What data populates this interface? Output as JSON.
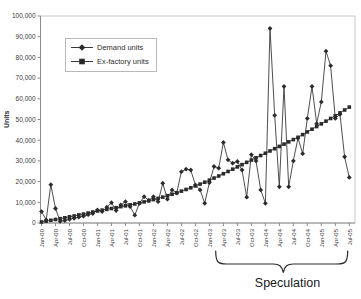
{
  "chart_data": {
    "type": "line",
    "title": "",
    "xlabel": "",
    "ylabel": "Units",
    "ylim": [
      0,
      100000
    ],
    "ytick_step": 10000,
    "grid": false,
    "legend_position": "upper-left-inside",
    "x_tick_every": 3,
    "x_categories": [
      "Jan-00",
      "Feb-00",
      "Mar-00",
      "Apr-00",
      "May-00",
      "Jun-00",
      "Jul-00",
      "Aug-00",
      "Sep-00",
      "Oct-00",
      "Nov-00",
      "Dec-00",
      "Jan-01",
      "Feb-01",
      "Mar-01",
      "Apr-01",
      "May-01",
      "Jun-01",
      "Jul-01",
      "Aug-01",
      "Sep-01",
      "Oct-01",
      "Nov-01",
      "Dec-01",
      "Jan-02",
      "Feb-02",
      "Mar-02",
      "Apr-02",
      "May-02",
      "Jun-02",
      "Jul-02",
      "Aug-02",
      "Sep-02",
      "Oct-02",
      "Nov-02",
      "Dec-02",
      "Jan-03",
      "Feb-03",
      "Mar-03",
      "Apr-03",
      "May-03",
      "Jun-03",
      "Jul-03",
      "Aug-03",
      "Sep-03",
      "Oct-03",
      "Nov-03",
      "Dec-03",
      "Jan-04",
      "Feb-04",
      "Mar-04",
      "Apr-04",
      "May-04",
      "Jun-04",
      "Jul-04",
      "Aug-04",
      "Sep-04",
      "Oct-04",
      "Nov-04",
      "Dec-04",
      "Jan-05",
      "Feb-05",
      "Mar-05",
      "Apr-05",
      "May-05",
      "Jun-05",
      "Jul-05"
    ],
    "series": [
      {
        "name": "Demand units",
        "marker": "diamond",
        "color": "#2b2b2b",
        "values": [
          5500,
          1500,
          18500,
          7000,
          800,
          1200,
          1800,
          2300,
          2800,
          3300,
          4000,
          4600,
          6300,
          5500,
          7600,
          9800,
          6000,
          8700,
          10300,
          7900,
          3800,
          9500,
          12700,
          11000,
          12700,
          10300,
          19200,
          11500,
          16000,
          14400,
          24800,
          26000,
          25600,
          18400,
          16000,
          9500,
          19500,
          27300,
          26500,
          38900,
          30500,
          28900,
          29700,
          25600,
          12500,
          33000,
          30000,
          16000,
          9500,
          94000,
          52000,
          17500,
          66000,
          17500,
          30000,
          41000,
          33500,
          50500,
          66000,
          48000,
          58500,
          83000,
          76000,
          50500,
          52500,
          32000,
          22000
        ]
      },
      {
        "name": "Ex-factory units",
        "marker": "square",
        "color": "#2b2b2b",
        "values": [
          500,
          900,
          1300,
          1700,
          2100,
          2500,
          3000,
          3400,
          3900,
          4300,
          4800,
          5300,
          5800,
          6200,
          6600,
          7000,
          7400,
          7900,
          8300,
          8800,
          9200,
          9700,
          10200,
          10700,
          11300,
          11900,
          12500,
          13200,
          13900,
          14600,
          15400,
          16200,
          17000,
          17900,
          18800,
          19700,
          20700,
          21700,
          22700,
          23800,
          24900,
          26000,
          27100,
          28200,
          29300,
          30400,
          31500,
          32600,
          33700,
          34800,
          35900,
          37000,
          38100,
          39200,
          40300,
          41400,
          42700,
          44000,
          45300,
          46600,
          47900,
          49200,
          50500,
          51800,
          53200,
          54600,
          56000
        ]
      }
    ],
    "annotation": {
      "text": "Speculation",
      "range_start_label": "Jul-03",
      "range_end_label": "Jul-05"
    }
  },
  "colors": {
    "plot_border": "#c9c9c9",
    "axis": "#8c8c8c",
    "tick_text": "#3a3a3a",
    "series_line": "#3a3a3a",
    "annotation": "#2a2a2a"
  }
}
